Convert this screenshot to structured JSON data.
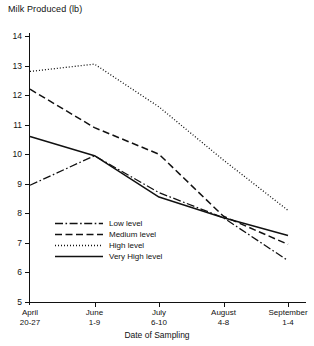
{
  "chart_data": {
    "type": "line",
    "title": "",
    "ylabel": "Milk Produced (lb)",
    "xlabel": "Date of Sampling",
    "categories": [
      "April 20-27",
      "June 1-9",
      "July 6-10",
      "August 4-8",
      "September 1-4"
    ],
    "category_lines": [
      [
        "April",
        "20-27"
      ],
      [
        "June",
        "1-9"
      ],
      [
        "July",
        "6-10"
      ],
      [
        "August",
        "4-8"
      ],
      [
        "September",
        "1-4"
      ]
    ],
    "ylim": [
      5,
      14
    ],
    "yticks": [
      5,
      6,
      7,
      8,
      9,
      10,
      11,
      12,
      13,
      14
    ],
    "ytick_labels": [
      "5",
      "6",
      "7",
      "8",
      "9",
      "10",
      "11",
      "12",
      "13",
      "14"
    ],
    "grid": false,
    "legend_position": "inside-lower-left",
    "series": [
      {
        "name": "Low level",
        "style": "dash-dot",
        "values": [
          8.95,
          9.95,
          8.7,
          7.85,
          6.4
        ]
      },
      {
        "name": "Medium level",
        "style": "long-dash",
        "values": [
          12.2,
          10.9,
          10.0,
          7.9,
          6.95
        ]
      },
      {
        "name": "High level",
        "style": "dotted",
        "values": [
          12.8,
          13.05,
          11.6,
          9.8,
          8.1
        ]
      },
      {
        "name": "Very High level",
        "style": "solid",
        "values": [
          10.6,
          9.95,
          8.55,
          7.85,
          7.25
        ]
      }
    ]
  },
  "legend": {
    "items": [
      {
        "label": "Low level"
      },
      {
        "label": "Medium level"
      },
      {
        "label": "High level"
      },
      {
        "label": "Very High level"
      }
    ]
  },
  "colors": {
    "ink": "#111111",
    "background": "#ffffff"
  }
}
